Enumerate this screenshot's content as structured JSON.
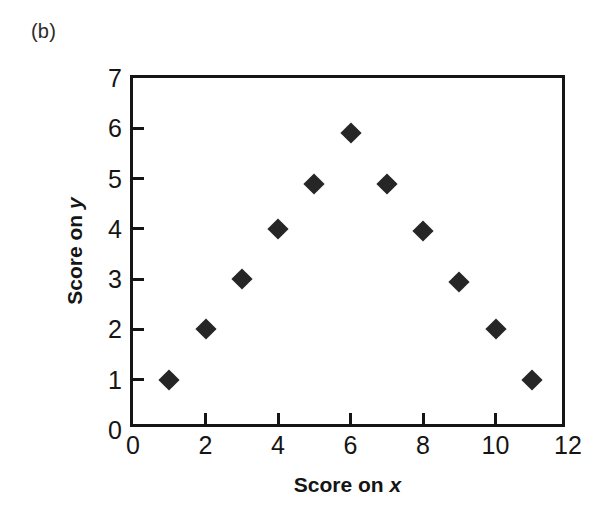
{
  "panel": {
    "label": "(b)"
  },
  "axes": {
    "x_title_prefix": "Score on ",
    "x_title_var": "x",
    "y_title_prefix": "Score on ",
    "y_title_var": "y"
  },
  "chart_data": {
    "type": "scatter",
    "title": "",
    "subtitle": "",
    "panel_label": "(b)",
    "xlabel": "Score on x",
    "ylabel": "Score on y",
    "xlim": [
      0,
      12
    ],
    "ylim": [
      0,
      7
    ],
    "xticks": [
      0,
      2,
      4,
      6,
      8,
      10,
      12
    ],
    "xtick_labels": [
      "0",
      "2",
      "4",
      "6",
      "8",
      "10",
      "12"
    ],
    "yticks": [
      0,
      1,
      2,
      3,
      4,
      5,
      6,
      7
    ],
    "ytick_labels": [
      "0",
      "1",
      "2",
      "3",
      "4",
      "5",
      "6",
      "7"
    ],
    "grid": false,
    "legend": false,
    "marker": "filled-diamond",
    "marker_color": "#262626",
    "frame_color": "#151515",
    "background": "#ffffff",
    "series": [
      {
        "name": "Score on y vs Score on x",
        "points": [
          {
            "x": 1,
            "y": 1.0
          },
          {
            "x": 2,
            "y": 2.0
          },
          {
            "x": 3,
            "y": 3.0
          },
          {
            "x": 4,
            "y": 4.0
          },
          {
            "x": 5,
            "y": 4.9
          },
          {
            "x": 6,
            "y": 5.9
          },
          {
            "x": 7,
            "y": 4.9
          },
          {
            "x": 8,
            "y": 3.95
          },
          {
            "x": 9,
            "y": 2.95
          },
          {
            "x": 10,
            "y": 2.0
          },
          {
            "x": 11,
            "y": 1.0
          }
        ]
      }
    ]
  }
}
